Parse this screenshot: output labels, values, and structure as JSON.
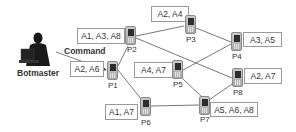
{
  "botmaster": {
    "label": "Botmaster"
  },
  "command": {
    "label": "Command"
  },
  "nodes": [
    {
      "id": "P1",
      "label": "P1",
      "apps": "A2, A6"
    },
    {
      "id": "P2",
      "label": "P2",
      "apps": "A1, A3, A8"
    },
    {
      "id": "P3",
      "label": "P3",
      "apps": "A2, A4"
    },
    {
      "id": "P4",
      "label": "P4",
      "apps": "A3, A5"
    },
    {
      "id": "P5",
      "label": "P5",
      "apps": "A4, A7"
    },
    {
      "id": "P6",
      "label": "P6",
      "apps": "A1, A7"
    },
    {
      "id": "P7",
      "label": "P7",
      "apps": "A5, A6, A8"
    },
    {
      "id": "P8",
      "label": "P8",
      "apps": "A2, A7"
    }
  ],
  "edges": [
    [
      "Botmaster",
      "P1"
    ],
    [
      "P1",
      "P2"
    ],
    [
      "P1",
      "P6"
    ],
    [
      "P2",
      "P3"
    ],
    [
      "P2",
      "P8"
    ],
    [
      "P3",
      "P4"
    ],
    [
      "P4",
      "P5"
    ],
    [
      "P5",
      "P7"
    ],
    [
      "P6",
      "P7"
    ],
    [
      "P7",
      "P8"
    ]
  ]
}
